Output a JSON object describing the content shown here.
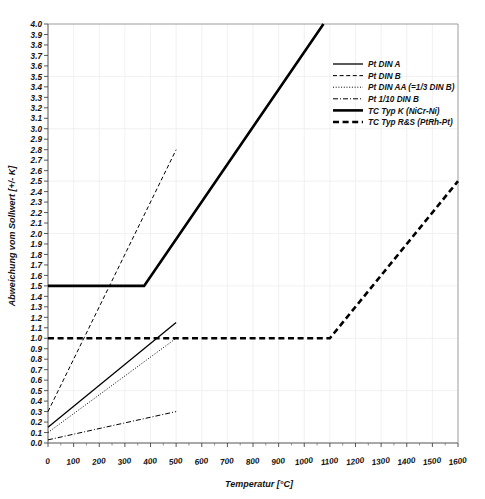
{
  "chart_data": {
    "type": "line",
    "title": "",
    "xlabel": "Temperatur [°C]",
    "ylabel": "Abweichung vom Sollwert [+/- K]",
    "xlim": [
      0,
      1600
    ],
    "ylim": [
      0.0,
      4.0
    ],
    "xticks": [
      0,
      100,
      200,
      300,
      400,
      500,
      600,
      700,
      800,
      900,
      1000,
      1100,
      1200,
      1300,
      1400,
      1500,
      1600
    ],
    "xtick_labels": [
      "0",
      "100",
      "200",
      "300",
      "400",
      "500",
      "600",
      "700",
      "800",
      "900",
      "1000",
      "1100",
      "1200",
      "1300",
      "1400",
      "1500",
      "1600"
    ],
    "yticks": [
      0.0,
      0.1,
      0.2,
      0.3,
      0.4,
      0.5,
      0.6,
      0.7,
      0.8,
      0.9,
      1.0,
      1.1,
      1.2,
      1.3,
      1.4,
      1.5,
      1.6,
      1.7,
      1.8,
      1.9,
      2.0,
      2.1,
      2.2,
      2.3,
      2.4,
      2.5,
      2.6,
      2.7,
      2.8,
      2.9,
      3.0,
      3.1,
      3.2,
      3.3,
      3.4,
      3.5,
      3.6,
      3.7,
      3.8,
      3.9,
      4.0
    ],
    "ytick_labels": [
      "0.0",
      "0.1",
      "0.2",
      "0.3",
      "0.4",
      "0.5",
      "0.6",
      "0.7",
      "0.8",
      "0.9",
      "1.0",
      "1.1",
      "1.2",
      "1.3",
      "1.4",
      "1.5",
      "1.6",
      "1.7",
      "1.8",
      "1.9",
      "2.0",
      "2.1",
      "2.2",
      "2.3",
      "2.4",
      "2.5",
      "2.6",
      "2.7",
      "2.8",
      "2.9",
      "3.0",
      "3.1",
      "3.2",
      "3.3",
      "3.4",
      "3.5",
      "3.6",
      "3.7",
      "3.8",
      "3.9",
      "4.0"
    ],
    "grid": true,
    "grid_color": "#ededed",
    "legend_position": "upper-right",
    "series": [
      {
        "name": "Pt DIN A",
        "style": "solid",
        "width": 1.3,
        "color": "#000000",
        "points": [
          [
            0,
            0.15
          ],
          [
            500,
            1.15
          ]
        ]
      },
      {
        "name": "Pt DIN B",
        "style": "dashed",
        "width": 1.0,
        "color": "#000000",
        "points": [
          [
            0,
            0.3
          ],
          [
            500,
            2.8
          ]
        ]
      },
      {
        "name": "Pt DIN AA (=1/3 DIN B)",
        "style": "dotted",
        "width": 1.0,
        "color": "#000000",
        "points": [
          [
            0,
            0.1
          ],
          [
            500,
            1.0
          ]
        ]
      },
      {
        "name": "Pt 1/10 DIN B",
        "style": "dashdot",
        "width": 1.0,
        "color": "#000000",
        "points": [
          [
            0,
            0.03
          ],
          [
            500,
            0.3
          ]
        ]
      },
      {
        "name": "TC Typ K (NiCr-Ni)",
        "style": "solid",
        "width": 2.6,
        "color": "#000000",
        "points": [
          [
            0,
            1.5
          ],
          [
            375,
            1.5
          ],
          [
            1075,
            4.0
          ]
        ]
      },
      {
        "name": "TC Typ R&S (PtRh-Pt)",
        "style": "dashed-thick",
        "width": 2.6,
        "color": "#000000",
        "points": [
          [
            0,
            1.0
          ],
          [
            1100,
            1.0
          ],
          [
            1600,
            2.5
          ]
        ]
      }
    ]
  }
}
